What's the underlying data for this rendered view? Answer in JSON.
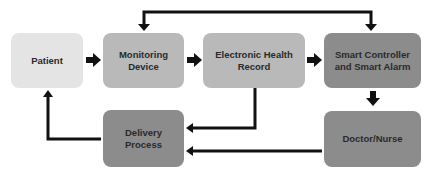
{
  "diagram": {
    "nodes": [
      {
        "id": "patient",
        "label_lines": [
          "Patient"
        ],
        "color": "#e4e4e4"
      },
      {
        "id": "monitoring-device",
        "label_lines": [
          "Monitoring",
          "Device"
        ],
        "color": "#b9b9b9"
      },
      {
        "id": "electronic-health-record",
        "label_lines": [
          "Electronic Health",
          "Record"
        ],
        "color": "#b9b9b9"
      },
      {
        "id": "smart-controller",
        "label_lines": [
          "Smart Controller",
          "and Smart Alarm"
        ],
        "color": "#8c8c8c"
      },
      {
        "id": "delivery-process",
        "label_lines": [
          "Delivery",
          "Process"
        ],
        "color": "#8c8c8c"
      },
      {
        "id": "doctor-nurse",
        "label_lines": [
          "Doctor/Nurse"
        ],
        "color": "#8c8c8c"
      }
    ],
    "edges": [
      {
        "from": "patient",
        "to": "monitoring-device"
      },
      {
        "from": "monitoring-device",
        "to": "electronic-health-record"
      },
      {
        "from": "electronic-health-record",
        "to": "smart-controller"
      },
      {
        "from": "top-loop",
        "to": "monitoring-device"
      },
      {
        "from": "top-loop",
        "to": "smart-controller"
      },
      {
        "from": "smart-controller",
        "to": "doctor-nurse"
      },
      {
        "from": "electronic-health-record",
        "to": "delivery-process"
      },
      {
        "from": "doctor-nurse",
        "to": "delivery-process"
      },
      {
        "from": "delivery-process",
        "to": "patient"
      }
    ],
    "arrow_color": "#111111"
  }
}
